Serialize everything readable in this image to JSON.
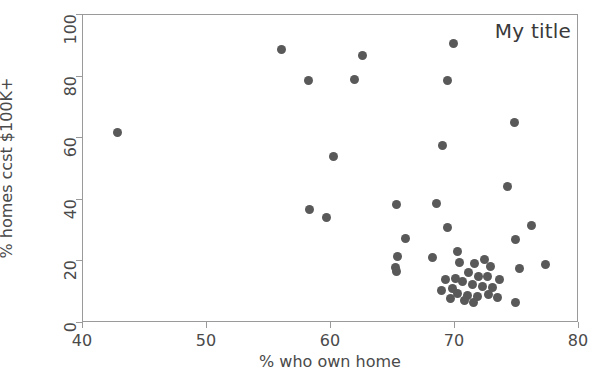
{
  "chart_data": {
    "type": "scatter",
    "title": "My title",
    "xlabel": "% who own home",
    "ylabel": "% homes ccst $100K+",
    "xlim": [
      40,
      80
    ],
    "ylim": [
      0,
      100
    ],
    "xticks": [
      40,
      50,
      60,
      70,
      80
    ],
    "yticks": [
      0,
      20,
      40,
      60,
      80,
      100
    ],
    "xticklabels": [
      "40",
      "50",
      "60",
      "70",
      "80"
    ],
    "yticklabels": [
      "0",
      "20",
      "40",
      "60",
      "80",
      "100"
    ],
    "grid": false,
    "legend": null,
    "marker": {
      "shape": "circle",
      "color": "#595959",
      "size": 9
    },
    "series": [
      {
        "name": "states",
        "points": [
          [
            42.8,
            62.0
          ],
          [
            56.0,
            88.8
          ],
          [
            58.2,
            78.6
          ],
          [
            62.5,
            86.8
          ],
          [
            61.9,
            79.2
          ],
          [
            69.9,
            90.8
          ],
          [
            69.4,
            78.8
          ],
          [
            74.8,
            65.0
          ],
          [
            69.0,
            57.5
          ],
          [
            60.2,
            54.0
          ],
          [
            74.2,
            44.2
          ],
          [
            65.3,
            38.6
          ],
          [
            68.5,
            38.8
          ],
          [
            58.3,
            36.8
          ],
          [
            59.6,
            34.4
          ],
          [
            76.2,
            31.6
          ],
          [
            69.4,
            31.0
          ],
          [
            66.0,
            27.4
          ],
          [
            74.9,
            27.0
          ],
          [
            77.3,
            19.0
          ],
          [
            65.4,
            21.6
          ],
          [
            68.2,
            21.2
          ],
          [
            65.2,
            18.0
          ],
          [
            65.3,
            16.8
          ],
          [
            75.2,
            17.6
          ],
          [
            72.9,
            18.2
          ],
          [
            70.2,
            23.2
          ],
          [
            70.4,
            19.8
          ],
          [
            71.6,
            19.4
          ],
          [
            71.1,
            16.4
          ],
          [
            71.9,
            15.2
          ],
          [
            72.6,
            15.0
          ],
          [
            73.6,
            14.0
          ],
          [
            70.6,
            13.6
          ],
          [
            71.4,
            12.6
          ],
          [
            72.2,
            12.0
          ],
          [
            69.8,
            11.2
          ],
          [
            70.2,
            9.6
          ],
          [
            71.0,
            8.8
          ],
          [
            71.8,
            8.6
          ],
          [
            72.7,
            9.2
          ],
          [
            73.4,
            8.4
          ],
          [
            70.8,
            7.2
          ],
          [
            71.5,
            6.6
          ],
          [
            69.6,
            7.8
          ],
          [
            74.9,
            6.8
          ],
          [
            68.9,
            10.6
          ],
          [
            73.0,
            11.4
          ],
          [
            70.0,
            14.6
          ],
          [
            69.2,
            14.2
          ],
          [
            72.4,
            20.6
          ]
        ]
      }
    ]
  }
}
